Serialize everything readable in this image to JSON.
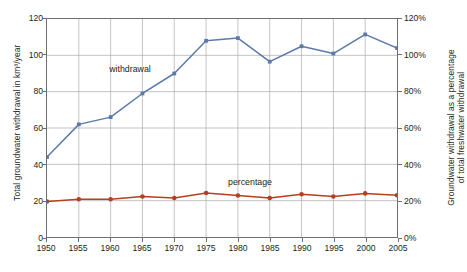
{
  "axes": {
    "left_title": "Total groundwater withdrawal in km³/year",
    "right_title_line1": "Groundwater withdrawal as a percentage",
    "right_title_line2": "of total freshwater withdrawal",
    "left_ticks": [
      "0",
      "20",
      "40",
      "60",
      "80",
      "100",
      "120"
    ],
    "right_ticks": [
      "0%",
      "20%",
      "40%",
      "60%",
      "80%",
      "100%",
      "120%"
    ],
    "x_ticks": [
      "1950",
      "1955",
      "1960",
      "1965",
      "1970",
      "1975",
      "1980",
      "1985",
      "1990",
      "1995",
      "2000",
      "2005"
    ]
  },
  "series_labels": {
    "withdrawal": "withdrawal",
    "percentage": "percentage"
  },
  "colors": {
    "withdrawal_line": "#5b7aa8",
    "percentage_line": "#b5401f",
    "axis": "#6d6e71",
    "grid": "#a7a9ac",
    "text": "#231f20"
  },
  "chart_data": {
    "type": "line",
    "title": "",
    "xlabel": "",
    "ylabel": "Total groundwater withdrawal in km³/year",
    "y2label": "Groundwater withdrawal as a percentage of total freshwater withdrawal",
    "x": [
      1950,
      1955,
      1960,
      1965,
      1970,
      1975,
      1980,
      1985,
      1990,
      1995,
      2000,
      2005
    ],
    "ylim": [
      0,
      120
    ],
    "y2lim": [
      0,
      120
    ],
    "yticks": [
      0,
      20,
      40,
      60,
      80,
      100,
      120
    ],
    "y2ticks": [
      0,
      20,
      40,
      60,
      80,
      100,
      120
    ],
    "grid": true,
    "legend": "inline-labels",
    "series": [
      {
        "name": "withdrawal",
        "axis": "left",
        "unit": "km³/year",
        "color": "#5b7aa8",
        "values": [
          44,
          62,
          66,
          79,
          90,
          108,
          109.5,
          96.5,
          105,
          101,
          111.5,
          104
        ]
      },
      {
        "name": "percentage",
        "axis": "right",
        "unit": "%",
        "color": "#b5401f",
        "values": [
          19.5,
          20.8,
          20.8,
          22.3,
          21.5,
          24.2,
          22.8,
          21.5,
          23.5,
          22.3,
          24.0,
          23.0
        ]
      }
    ]
  }
}
